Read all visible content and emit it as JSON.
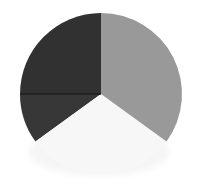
{
  "page": {
    "background_color": "#ffffff"
  },
  "chart_data": {
    "type": "pie",
    "title": "",
    "xlabel": "",
    "ylabel": "",
    "legend": "none",
    "labels_visible": false,
    "start_angle_deg": 90,
    "direction": "counterclockwise",
    "values": [
      25,
      10,
      30,
      35
    ],
    "slices": [
      {
        "name": "dark-upper-left-slice",
        "value": 25,
        "color": "#313131"
      },
      {
        "name": "dark-lower-left-slice",
        "value": 10,
        "color": "#373737"
      },
      {
        "name": "light-bottom-slice",
        "value": 30,
        "color": "#f7f7f7"
      },
      {
        "name": "gray-right-slice",
        "value": 35,
        "color": "#999999"
      }
    ],
    "slice_divider": {
      "between": [
        "dark-upper-left-slice",
        "dark-lower-left-slice"
      ],
      "angle_deg": 180,
      "color": "#1f1f1f",
      "width": 1.4
    },
    "shadow_color": "#e9e9e9"
  }
}
